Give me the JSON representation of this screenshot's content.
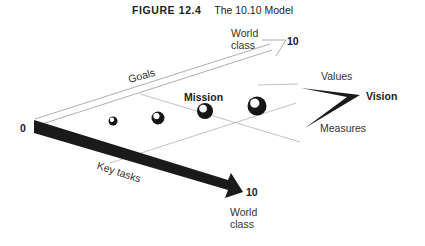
{
  "figure": {
    "number": "FIGURE 12.4",
    "title": "The 10.10 Model"
  },
  "axes": {
    "origin_label": "0",
    "goals": {
      "label": "Goals",
      "end_value": "10",
      "end_label_line1": "World",
      "end_label_line2": "class"
    },
    "key_tasks": {
      "label": "Key  tasks",
      "end_value": "10",
      "end_label_line1": "World",
      "end_label_line2": "class"
    }
  },
  "plane": {
    "mission_label": "Mission",
    "spheres": [
      {
        "name": "sphere-1",
        "size": "small"
      },
      {
        "name": "sphere-2",
        "size": "medium"
      },
      {
        "name": "sphere-3",
        "size": "large"
      },
      {
        "name": "sphere-4",
        "size": "largest"
      }
    ]
  },
  "vision": {
    "label": "Vision",
    "upper_label": "Values",
    "lower_label": "Measures"
  }
}
